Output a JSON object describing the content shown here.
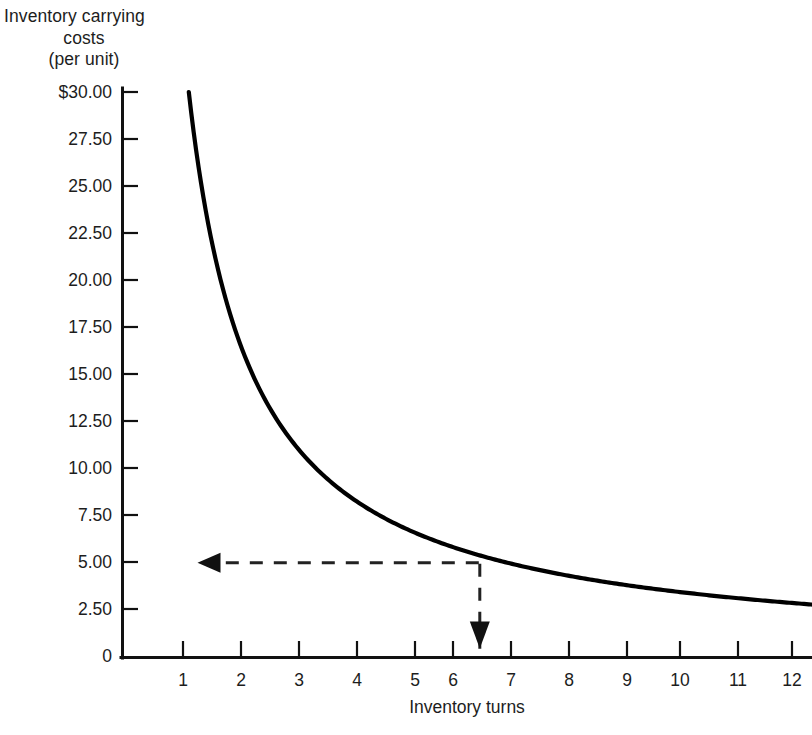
{
  "chart_data": {
    "type": "line",
    "title": "",
    "ylabel_lines": [
      "Inventory carrying",
      "costs",
      "(per unit)"
    ],
    "ylabel": "Inventory carrying costs (per unit)",
    "xlabel": "Inventory turns",
    "xlim": [
      0,
      12.6
    ],
    "ylim": [
      0,
      30
    ],
    "grid": false,
    "legend": null,
    "y_ticks": [
      {
        "value": 30.0,
        "label": "$30.00"
      },
      {
        "value": 27.5,
        "label": "27.50"
      },
      {
        "value": 25.0,
        "label": "25.00"
      },
      {
        "value": 22.5,
        "label": "22.50"
      },
      {
        "value": 20.0,
        "label": "20.00"
      },
      {
        "value": 17.5,
        "label": "17.50"
      },
      {
        "value": 15.0,
        "label": "15.00"
      },
      {
        "value": 12.5,
        "label": "12.50"
      },
      {
        "value": 10.0,
        "label": "10.00"
      },
      {
        "value": 7.5,
        "label": "7.50"
      },
      {
        "value": 5.0,
        "label": "5.00"
      },
      {
        "value": 2.5,
        "label": "2.50"
      },
      {
        "value": 0,
        "label": "0"
      }
    ],
    "x_ticks": [
      {
        "value": 1,
        "label": "1"
      },
      {
        "value": 2,
        "label": "2"
      },
      {
        "value": 3,
        "label": "3"
      },
      {
        "value": 4,
        "label": "4"
      },
      {
        "value": 5,
        "label": "5"
      },
      {
        "value": 6,
        "label": "6"
      },
      {
        "value": 7,
        "label": "7"
      },
      {
        "value": 8,
        "label": "8"
      },
      {
        "value": 9,
        "label": "9"
      },
      {
        "value": 10,
        "label": "10"
      },
      {
        "value": 11,
        "label": "11"
      },
      {
        "value": 12,
        "label": "12"
      }
    ],
    "series": [
      {
        "name": "Inventory carrying cost curve",
        "color": "#000000",
        "x": [
          1.1,
          1.25,
          1.5,
          1.75,
          2.0,
          2.25,
          2.5,
          2.75,
          3.0,
          3.5,
          4.0,
          4.5,
          5.0,
          5.5,
          6.0,
          6.1,
          6.5,
          7.0,
          7.5,
          8.0,
          8.5,
          9.0,
          9.5,
          10.0,
          10.5,
          11.0,
          11.5,
          12.0
        ],
        "y": [
          30.0,
          27.4,
          23.3,
          20.4,
          18.1,
          16.3,
          14.8,
          13.6,
          12.5,
          10.8,
          9.5,
          8.5,
          7.6,
          6.8,
          6.1,
          5.0,
          5.6,
          5.2,
          4.8,
          4.4,
          4.1,
          3.8,
          3.5,
          3.3,
          3.0,
          2.8,
          2.5,
          2.2
        ]
      }
    ],
    "annotations": [
      {
        "name": "cost-readout-arrow",
        "type": "dashed-arrow",
        "direction": "left",
        "from_x": 6.1,
        "from_y": 5.0,
        "to_x": 1.25,
        "to_y": 5.0,
        "reads": "5.00"
      },
      {
        "name": "turns-readout-arrow",
        "type": "dashed-arrow",
        "direction": "down",
        "from_x": 6.1,
        "from_y": 5.0,
        "to_x": 6.1,
        "to_y": 0.45,
        "reads": "6"
      }
    ]
  },
  "colors": {
    "background": "#ffffff",
    "axis": "#111111",
    "curve": "#000000",
    "annotation": "#222222",
    "text": "#1d1d1d"
  }
}
